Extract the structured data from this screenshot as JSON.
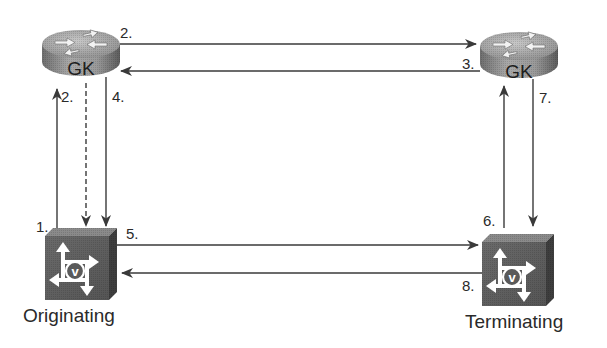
{
  "diagram": {
    "nodes": [
      {
        "id": "gk-left",
        "type": "gatekeeper-router",
        "label": "GK"
      },
      {
        "id": "gk-right",
        "type": "gatekeeper-router",
        "label": "GK"
      },
      {
        "id": "gw-originating",
        "type": "voice-gateway",
        "label": "Originating"
      },
      {
        "id": "gw-terminating",
        "type": "voice-gateway",
        "label": "Terminating"
      }
    ],
    "edges": [
      {
        "step": "1.",
        "from": "gw-originating",
        "to": "gk-left",
        "style": "solid"
      },
      {
        "step": "2.",
        "from": "gk-left",
        "to": "gw-originating",
        "style": "dashed"
      },
      {
        "step": "2.",
        "from": "gk-left",
        "to": "gk-right",
        "style": "solid"
      },
      {
        "step": "3.",
        "from": "gk-right",
        "to": "gk-left",
        "style": "solid"
      },
      {
        "step": "4.",
        "from": "gk-left",
        "to": "gw-originating",
        "style": "solid"
      },
      {
        "step": "5.",
        "from": "gw-originating",
        "to": "gw-terminating",
        "style": "solid"
      },
      {
        "step": "6.",
        "from": "gw-terminating",
        "to": "gk-right",
        "style": "solid"
      },
      {
        "step": "7.",
        "from": "gk-right",
        "to": "gw-terminating",
        "style": "solid"
      },
      {
        "step": "8.",
        "from": "gw-terminating",
        "to": "gw-originating",
        "style": "solid"
      }
    ],
    "step_labels": {
      "s1": "1.",
      "s2_top": "2.",
      "s2_left": "2.",
      "s3": "3.",
      "s4": "4.",
      "s5": "5.",
      "s6": "6.",
      "s7": "7.",
      "s8": "8."
    },
    "gk_left_label": "GK",
    "gk_right_label": "GK",
    "originating_label": "Originating",
    "terminating_label": "Terminating",
    "icons": {
      "router": "gatekeeper-router-icon",
      "gateway": "voice-gateway-icon"
    }
  }
}
